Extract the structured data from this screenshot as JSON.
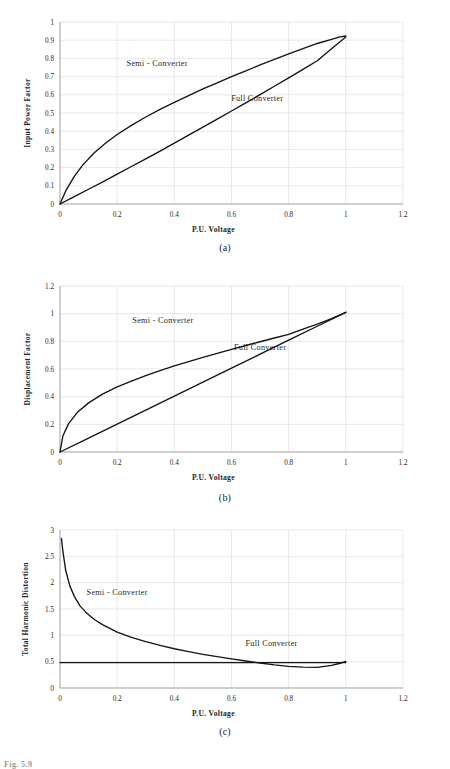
{
  "figure": {
    "footer_note": "Fig. 5.9",
    "shared": {
      "xlabel": "P.U. Voltage",
      "series_semi": "Semi - Converter",
      "series_full": "Full Converter",
      "curve_color": "#141414",
      "grid_color": "#d9d9d9",
      "axis_color": "#9a9a9a"
    },
    "panels": [
      {
        "id": "a",
        "caption": "(a)"
      },
      {
        "id": "b",
        "caption": "(b)"
      },
      {
        "id": "c",
        "caption": "(c)"
      }
    ]
  },
  "chart_data": [
    {
      "type": "line",
      "title": "",
      "panel": "(a)",
      "xlabel": "P.U. Voltage",
      "ylabel": "Input Power Factor",
      "xlim": [
        0,
        1.2
      ],
      "ylim": [
        0,
        1
      ],
      "xticks": [
        "0",
        "0.2",
        "0.4",
        "0.6",
        "0.8",
        "1",
        "1.2"
      ],
      "xtick_values": [
        0,
        0.2,
        0.4,
        0.6,
        0.8,
        1.0,
        1.2
      ],
      "yticks": [
        "0",
        "0.1",
        "0.2",
        "0.3",
        "0.4",
        "0.5",
        "0.6",
        "0.7",
        "0.8",
        "0.9",
        "1"
      ],
      "ytick_values": [
        0,
        0.1,
        0.2,
        0.3,
        0.4,
        0.5,
        0.6,
        0.7,
        0.8,
        0.9,
        1.0
      ],
      "grid": true,
      "legend": "inline-annotations",
      "annotations": [
        {
          "text": "Semi - Converter",
          "x": 0.34,
          "y": 0.76
        },
        {
          "text": "Full Converter",
          "x": 0.69,
          "y": 0.565
        }
      ],
      "series": [
        {
          "name": "Semi - Converter",
          "x": [
            0,
            0.02,
            0.05,
            0.08,
            0.12,
            0.16,
            0.2,
            0.25,
            0.3,
            0.35,
            0.4,
            0.45,
            0.5,
            0.55,
            0.6,
            0.65,
            0.7,
            0.75,
            0.8,
            0.85,
            0.9,
            0.95,
            0.98,
            1.0
          ],
          "y": [
            0,
            0.072,
            0.152,
            0.215,
            0.282,
            0.335,
            0.382,
            0.432,
            0.478,
            0.52,
            0.558,
            0.596,
            0.632,
            0.666,
            0.7,
            0.732,
            0.764,
            0.794,
            0.825,
            0.854,
            0.882,
            0.905,
            0.918,
            0.923
          ]
        },
        {
          "name": "Full Converter",
          "x": [
            0,
            0.05,
            0.1,
            0.15,
            0.2,
            0.25,
            0.3,
            0.35,
            0.4,
            0.45,
            0.5,
            0.55,
            0.6,
            0.65,
            0.7,
            0.75,
            0.8,
            0.85,
            0.9,
            0.95,
            1.0
          ],
          "y": [
            0,
            0.04,
            0.081,
            0.122,
            0.164,
            0.206,
            0.248,
            0.291,
            0.334,
            0.378,
            0.422,
            0.466,
            0.511,
            0.556,
            0.601,
            0.647,
            0.693,
            0.74,
            0.787,
            0.853,
            0.918
          ]
        }
      ]
    },
    {
      "type": "line",
      "title": "",
      "panel": "(b)",
      "xlabel": "P.U. Voltage",
      "ylabel": "Displacement Factor",
      "xlim": [
        0,
        1.2
      ],
      "ylim": [
        0,
        1.2
      ],
      "xticks": [
        "0",
        "0.2",
        "0.4",
        "0.6",
        "0.8",
        "1",
        "1.2"
      ],
      "xtick_values": [
        0,
        0.2,
        0.4,
        0.6,
        0.8,
        1.0,
        1.2
      ],
      "yticks": [
        "0",
        "0.2",
        "0.4",
        "0.6",
        "0.8",
        "1",
        "1.2"
      ],
      "ytick_values": [
        0,
        0.2,
        0.4,
        0.6,
        0.8,
        1.0,
        1.2
      ],
      "grid": true,
      "legend": "inline-annotations",
      "annotations": [
        {
          "text": "Semi - Converter",
          "x": 0.36,
          "y": 0.935
        },
        {
          "text": "Full Converter",
          "x": 0.7,
          "y": 0.735
        }
      ],
      "series": [
        {
          "name": "Semi - Converter",
          "x": [
            0,
            0.01,
            0.03,
            0.06,
            0.1,
            0.15,
            0.2,
            0.25,
            0.3,
            0.35,
            0.4,
            0.45,
            0.5,
            0.55,
            0.6,
            0.65,
            0.7,
            0.75,
            0.8,
            0.85,
            0.9,
            0.95,
            1.0
          ],
          "y": [
            0,
            0.115,
            0.205,
            0.285,
            0.355,
            0.42,
            0.47,
            0.512,
            0.552,
            0.588,
            0.622,
            0.654,
            0.684,
            0.713,
            0.742,
            0.77,
            0.797,
            0.824,
            0.85,
            0.888,
            0.925,
            0.965,
            1.01
          ]
        },
        {
          "name": "Full Converter",
          "x": [
            0,
            0.1,
            0.2,
            0.3,
            0.4,
            0.5,
            0.6,
            0.7,
            0.8,
            0.9,
            1.0
          ],
          "y": [
            0,
            0.101,
            0.202,
            0.303,
            0.404,
            0.505,
            0.606,
            0.707,
            0.808,
            0.909,
            1.01
          ]
        }
      ]
    },
    {
      "type": "line",
      "title": "",
      "panel": "(c)",
      "xlabel": "P.U. Voltage",
      "ylabel": "Total Harmonic Distortion",
      "xlim": [
        0,
        1.2
      ],
      "ylim": [
        0,
        3
      ],
      "xticks": [
        "0",
        "0.2",
        "0.4",
        "0.6",
        "0.8",
        "1",
        "1.2"
      ],
      "xtick_values": [
        0,
        0.2,
        0.4,
        0.6,
        0.8,
        1.0,
        1.2
      ],
      "yticks": [
        "0",
        "0.5",
        "1",
        "1.5",
        "2",
        "2.5",
        "3"
      ],
      "ytick_values": [
        0,
        0.5,
        1.0,
        1.5,
        2.0,
        2.5,
        3.0
      ],
      "grid": true,
      "legend": "inline-annotations",
      "annotations": [
        {
          "text": "Semi - Converter",
          "x": 0.2,
          "y": 1.77
        },
        {
          "text": "Full Converter",
          "x": 0.74,
          "y": 0.8
        }
      ],
      "series": [
        {
          "name": "Semi - Converter",
          "x": [
            0.005,
            0.01,
            0.02,
            0.035,
            0.05,
            0.07,
            0.09,
            0.12,
            0.15,
            0.2,
            0.25,
            0.3,
            0.35,
            0.4,
            0.45,
            0.5,
            0.55,
            0.6,
            0.65,
            0.7,
            0.75,
            0.8,
            0.85,
            0.9,
            0.95,
            0.98,
            1.0
          ],
          "y": [
            2.84,
            2.6,
            2.23,
            1.93,
            1.74,
            1.56,
            1.44,
            1.3,
            1.2,
            1.06,
            0.96,
            0.88,
            0.81,
            0.745,
            0.69,
            0.64,
            0.595,
            0.552,
            0.512,
            0.475,
            0.44,
            0.412,
            0.395,
            0.392,
            0.43,
            0.47,
            0.505
          ]
        },
        {
          "name": "Full Converter",
          "x": [
            0,
            0.2,
            0.4,
            0.6,
            0.8,
            1.0
          ],
          "y": [
            0.482,
            0.482,
            0.482,
            0.482,
            0.482,
            0.482
          ]
        }
      ]
    }
  ]
}
